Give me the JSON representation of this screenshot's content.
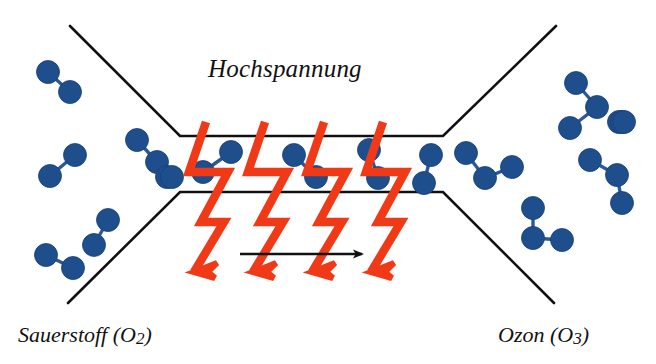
{
  "figure": {
    "title_label": "Hochspannung",
    "left_label": {
      "name": "Sauerstoff",
      "formula_prefix": "(O",
      "formula_sub": "2",
      "formula_suffix": ")"
    },
    "right_label": {
      "name": "Ozon",
      "formula_prefix": "(O",
      "formula_sub": "3",
      "formula_suffix": ")"
    },
    "colors": {
      "atom": "#1F4E8C",
      "atom_outline": "#17407a",
      "bond": "#2a5a96",
      "discharge": "#F03A17",
      "outline": "#111111",
      "flow_arrow": "#111111",
      "background": "#FFFFFF"
    }
  },
  "chamber": {
    "name": "reaction-chamber",
    "top_wall": {
      "left_diag_start": [
        70,
        26
      ],
      "corner": [
        180,
        136
      ],
      "corner_right": [
        443,
        136
      ],
      "right_diag_end": [
        556,
        26
      ]
    },
    "bottom_wall": {
      "left_diag_start": [
        68,
        303
      ],
      "corner": [
        180,
        192
      ],
      "corner_right": [
        443,
        192
      ],
      "right_diag_end": [
        554,
        303
      ]
    },
    "stroke_width": 2.6
  },
  "flow_arrow": {
    "name": "gas-flow-arrow",
    "x1": 240,
    "y1": 254,
    "x2": 362,
    "y2": 254,
    "direction": "right"
  },
  "discharges": [
    {
      "name": "lightning-bolt-1",
      "x": 206,
      "y": 122
    },
    {
      "name": "lightning-bolt-2",
      "x": 265,
      "y": 122
    },
    {
      "name": "lightning-bolt-3",
      "x": 324,
      "y": 122
    },
    {
      "name": "lightning-bolt-4",
      "x": 383,
      "y": 122
    }
  ],
  "molecules": {
    "oxygen_left": [
      {
        "name": "o2-molecule",
        "atoms": [
          [
            48,
            72
          ],
          [
            70,
            92
          ]
        ]
      },
      {
        "name": "o2-molecule",
        "atoms": [
          [
            75,
            155
          ],
          [
            50,
            176
          ]
        ]
      },
      {
        "name": "o2-molecule",
        "atoms": [
          [
            137,
            140
          ],
          [
            157,
            162
          ]
        ]
      },
      {
        "name": "o2-molecule",
        "atoms": [
          [
            108,
            220
          ],
          [
            94,
            245
          ]
        ]
      },
      {
        "name": "o2-molecule",
        "atoms": [
          [
            46,
            255
          ],
          [
            73,
            268
          ]
        ]
      },
      {
        "name": "o2-molecule",
        "atoms": [
          [
            167,
            177
          ],
          [
            172,
            177
          ]
        ]
      }
    ],
    "oxygen_chamber": [
      {
        "name": "o2-molecule",
        "atoms": [
          [
            231,
            152
          ],
          [
            203,
            172
          ]
        ]
      },
      {
        "name": "o2-molecule",
        "atoms": [
          [
            294,
            155
          ],
          [
            316,
            177
          ]
        ]
      },
      {
        "name": "o2-molecule",
        "atoms": [
          [
            369,
            150
          ],
          [
            378,
            178
          ]
        ]
      },
      {
        "name": "o2-molecule",
        "atoms": [
          [
            431,
            155
          ],
          [
            424,
            183
          ]
        ]
      }
    ],
    "ozone_right": [
      {
        "name": "o3-molecule",
        "atoms": [
          [
            466,
            153
          ],
          [
            485,
            178
          ],
          [
            512,
            167
          ]
        ]
      },
      {
        "name": "o3-molecule",
        "atoms": [
          [
            576,
            83
          ],
          [
            597,
            107
          ],
          [
            570,
            128
          ]
        ]
      },
      {
        "name": "o3-molecule",
        "atoms": [
          [
            590,
            160
          ],
          [
            617,
            175
          ],
          [
            622,
            203
          ]
        ]
      },
      {
        "name": "o3-molecule",
        "atoms": [
          [
            533,
            208
          ],
          [
            533,
            238
          ],
          [
            562,
            240
          ]
        ]
      },
      {
        "name": "o3-molecule",
        "atoms": [
          [
            619,
            122
          ],
          [
            622,
            122
          ],
          [
            624,
            122
          ]
        ]
      }
    ]
  }
}
